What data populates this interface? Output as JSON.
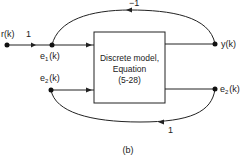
{
  "diagram": {
    "caption": "(b)",
    "block": {
      "line1": "Discrete model,",
      "line2": "Equation",
      "line3": "(5-28)"
    },
    "nodes": {
      "r": {
        "base": "r",
        "arg": "(k)"
      },
      "e1": {
        "base": "e",
        "sub": "1",
        "arg": "(k)"
      },
      "e2_left": {
        "base": "e",
        "sub": "2",
        "arg": "(k)"
      },
      "y": {
        "base": "y",
        "arg": "(k)"
      },
      "e2_right": {
        "base": "e",
        "sub": "2",
        "arg": "(k)"
      }
    },
    "edges": {
      "r_to_e1_gain": "1",
      "feedback_top_gain": "−1",
      "feedback_bottom_gain": "1"
    }
  }
}
